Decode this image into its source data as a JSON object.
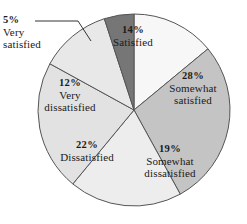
{
  "chart_data": {
    "type": "pie",
    "title": "",
    "subtitle": "",
    "xlabel": "",
    "ylabel": "",
    "legend_position": "none",
    "grid": false,
    "units": "percent",
    "total": 100,
    "categories": [
      "Satisfied",
      "Somewhat satisfied",
      "Somewhat dissatisfied",
      "Dissatisfied",
      "Very dissatisfied",
      "Very satisfied"
    ],
    "values": [
      14,
      28,
      19,
      22,
      12,
      5
    ],
    "slices": [
      {
        "id": "satisfied",
        "percent_text": "14%",
        "value": 14,
        "name_line1": "Satisfied",
        "name_line2": "",
        "color": "#f7f7f7",
        "start_angle_deg": 0,
        "end_angle_deg": 50.4,
        "label_inside": true
      },
      {
        "id": "somewhat-satisfied",
        "percent_text": "28%",
        "value": 28,
        "name_line1": "Somewhat",
        "name_line2": "satisfied",
        "color": "#c4c4c4",
        "start_angle_deg": 50.4,
        "end_angle_deg": 151.2,
        "label_inside": true
      },
      {
        "id": "somewhat-dissatisfied",
        "percent_text": "19%",
        "value": 19,
        "name_line1": "Somewhat",
        "name_line2": "dissatisfied",
        "color": "#ededed",
        "start_angle_deg": 151.2,
        "end_angle_deg": 219.6,
        "label_inside": true
      },
      {
        "id": "dissatisfied",
        "percent_text": "22%",
        "value": 22,
        "name_line1": "Dissatisfied",
        "name_line2": "",
        "color": "#e2e2e2",
        "start_angle_deg": 219.6,
        "end_angle_deg": 298.8,
        "label_inside": true
      },
      {
        "id": "very-dissatisfied",
        "percent_text": "12%",
        "value": 12,
        "name_line1": "Very",
        "name_line2": "dissatisfied",
        "color": "#e8e8e8",
        "start_angle_deg": 298.8,
        "end_angle_deg": 342.0,
        "label_inside": true
      },
      {
        "id": "very-satisfied",
        "percent_text": "5%",
        "value": 5,
        "name_line1": "Very",
        "name_line2": "satisfied",
        "color": "#767676",
        "start_angle_deg": 342.0,
        "end_angle_deg": 360.0,
        "label_inside": false
      }
    ],
    "geometry": {
      "center_x": 134,
      "center_y": 110,
      "radius": 96,
      "stroke_color": "#555555",
      "stroke_width": 1
    },
    "leader_line": {
      "for_slice": "very-satisfied",
      "points": "35,21 78,21 91,41"
    }
  }
}
